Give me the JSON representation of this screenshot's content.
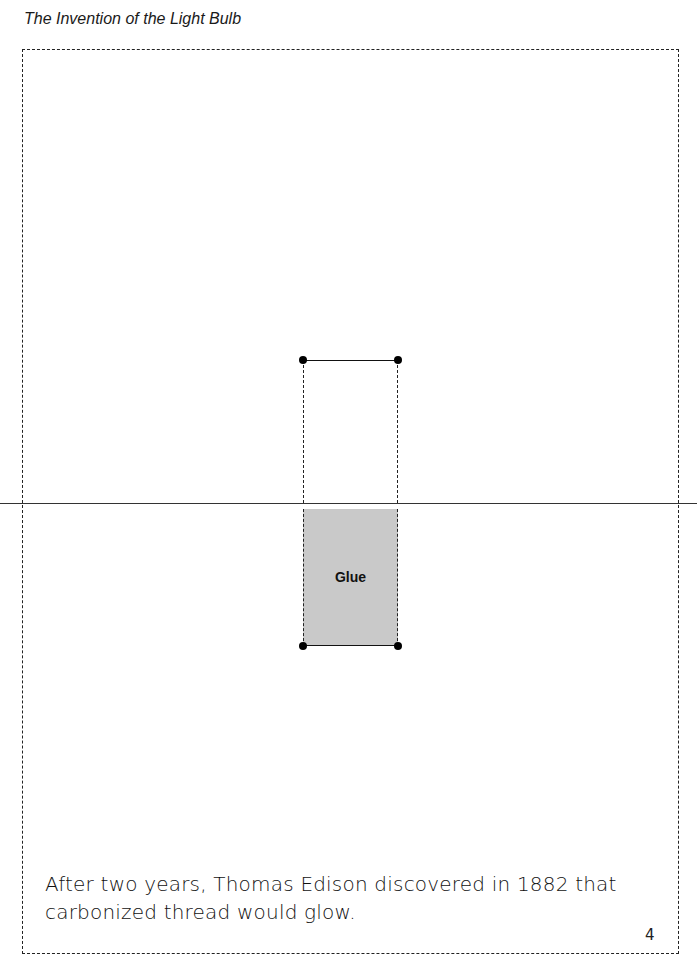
{
  "header": {
    "title": "The Invention of the Light Bulb"
  },
  "diagram": {
    "glue_label": "Glue"
  },
  "caption": {
    "text": "After two years, Thomas Edison discovered in 1882 that carbonized thread would glow."
  },
  "page": {
    "number": "4"
  },
  "colors": {
    "glue_fill": "#c9c9c9",
    "line": "#222222"
  }
}
